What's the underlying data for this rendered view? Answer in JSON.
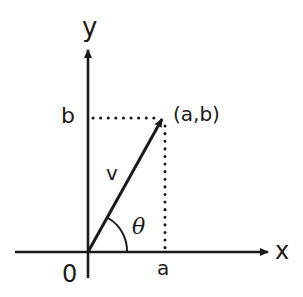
{
  "diagram": {
    "type": "vector-coordinate-plane",
    "labels": {
      "y_axis": "y",
      "x_axis": "x",
      "origin": "0",
      "b_tick": "b",
      "a_tick": "a",
      "point": "(a,b)",
      "vector": "v",
      "angle": "θ"
    },
    "colors": {
      "ink": "#1a1a1a",
      "background": "#ffffff"
    }
  }
}
